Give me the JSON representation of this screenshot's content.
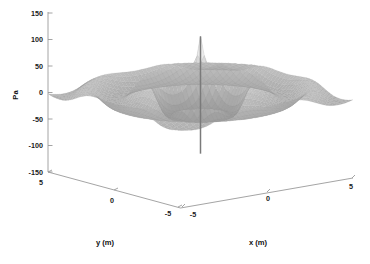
{
  "chart_data": {
    "type": "surface",
    "title": "",
    "subtitle": "",
    "zlabel": "Pa",
    "xlabel": "x (m)",
    "ylabel": "y (m)",
    "grid": false,
    "legend": "none",
    "colormap": "grayscale",
    "projection": "3d-mesh-surface",
    "zlim": [
      -150,
      150
    ],
    "xlim": [
      -5,
      5
    ],
    "ylim": [
      -5,
      5
    ],
    "zticks": [
      "150",
      "100",
      "50",
      "0",
      "-50",
      "-100",
      "-150"
    ],
    "ztick_values": [
      150,
      100,
      50,
      0,
      -50,
      -100,
      -150
    ],
    "xticks": [
      "-5",
      "0",
      "5"
    ],
    "xtick_values": [
      -5,
      0,
      5
    ],
    "yticks": [
      "5",
      "0",
      "-5"
    ],
    "ytick_values": [
      5,
      0,
      -5
    ],
    "surface": {
      "rings": 4,
      "ring_radii": [
        1.0,
        2.1,
        3.2,
        4.3
      ],
      "peak_amplitude": 110,
      "ambient_amplitude": 40,
      "spike_center": [
        0,
        0
      ],
      "spike_top": 110,
      "spike_bottom": -110,
      "radial_decay": "1/r"
    },
    "colors": {
      "surface_light": "#f2f2f2",
      "surface_mid": "#c8c8c8",
      "surface_dark": "#9a9a9a",
      "surface_darkest": "#7a7a7a",
      "mesh_line": "#8c8c8c",
      "axis": "#9a9a9a",
      "text": "#111111",
      "background": "#ffffff"
    }
  },
  "axes": {
    "z": {
      "label": "Pa",
      "ticks": [
        {
          "text": "150",
          "y": 13
        },
        {
          "text": "100",
          "y": 39
        },
        {
          "text": "50",
          "y": 66
        },
        {
          "text": "0",
          "y": 93
        },
        {
          "text": "-50",
          "y": 119
        },
        {
          "text": "-100",
          "y": 146
        },
        {
          "text": "-150",
          "y": 172
        }
      ]
    },
    "y": {
      "label": "y (m)",
      "ticks": [
        {
          "text": "5",
          "x": 39,
          "y": 185
        },
        {
          "text": "0",
          "x": 103,
          "y": 204
        },
        {
          "text": "-5",
          "x": 166,
          "y": 215
        }
      ]
    },
    "x": {
      "label": "x (m)",
      "ticks": [
        {
          "text": "-5",
          "x": 192,
          "y": 216
        },
        {
          "text": "0",
          "x": 268,
          "y": 199
        },
        {
          "text": "5",
          "x": 350,
          "y": 189
        }
      ]
    }
  }
}
